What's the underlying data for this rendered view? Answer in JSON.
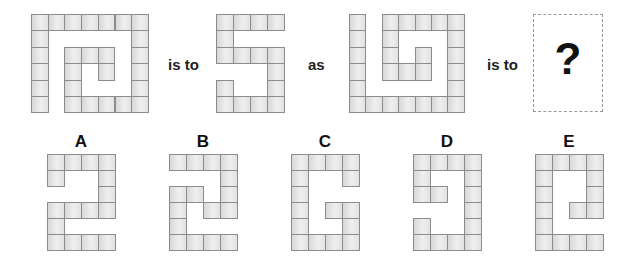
{
  "puzzle": {
    "words": [
      "is to",
      "as",
      "is to"
    ],
    "question_mark": "?",
    "cell_colors": {
      "border": "#8c8c8c",
      "fill_light": "#efefef",
      "fill_dark": "#d8d8d8"
    },
    "figures": [
      {
        "name": "figure-1-spiral",
        "cols": 7,
        "rows": 6,
        "x": 31,
        "y": 14,
        "cw": 16.7,
        "ch": 16.4,
        "grid": [
          "1111111",
          "1000001",
          "1011101",
          "1010101",
          "1010001",
          "1011111"
        ]
      },
      {
        "name": "figure-2-five",
        "cols": 4,
        "rows": 6,
        "x": 216,
        "y": 14,
        "cw": 17,
        "ch": 16.4,
        "grid": [
          "1111",
          "1000",
          "1111",
          "0001",
          "1001",
          "1111"
        ]
      },
      {
        "name": "figure-3-spiral",
        "cols": 7,
        "rows": 6,
        "x": 349,
        "y": 14,
        "cw": 16.4,
        "ch": 16.4,
        "grid": [
          "1011111",
          "1010001",
          "1010101",
          "1011101",
          "1000001",
          "1111111"
        ]
      }
    ]
  },
  "options": [
    {
      "label": "A",
      "x": 47,
      "grid": [
        "1111",
        "1001",
        "0001",
        "1111",
        "1000",
        "1111"
      ]
    },
    {
      "label": "B",
      "x": 169,
      "grid": [
        "1111",
        "0001",
        "1101",
        "1011",
        "1000",
        "1111"
      ]
    },
    {
      "label": "C",
      "x": 291,
      "grid": [
        "1111",
        "1001",
        "1000",
        "1011",
        "1001",
        "1111"
      ]
    },
    {
      "label": "D",
      "x": 413,
      "grid": [
        "1111",
        "1001",
        "1101",
        "0001",
        "1001",
        "1111"
      ]
    },
    {
      "label": "E",
      "x": 535,
      "grid": [
        "1111",
        "1001",
        "1001",
        "1011",
        "1000",
        "1111"
      ]
    }
  ]
}
